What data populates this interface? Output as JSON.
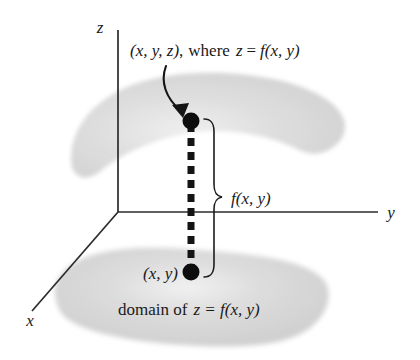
{
  "figure": {
    "background_color": "#ffffff",
    "ink_color": "#1a1a1a",
    "surface_color": "#d8d8d8"
  },
  "axes": {
    "z_label": "z",
    "y_label": "y",
    "x_label": "x",
    "origin": {
      "x": 118,
      "y": 212
    }
  },
  "labels": {
    "point_3d": {
      "prefix": "(x, y, z)",
      "comma": ",",
      "where": "where",
      "equation_lhs": "z",
      "equals": "=",
      "equation_rhs": "f(x, y)",
      "full_text": "(x, y, z), where z = f(x, y)"
    },
    "point_2d": "(x, y)",
    "height_label": "f(x, y)",
    "domain_label": {
      "prefix": "domain of",
      "equation": "z = f(x, y)",
      "full_text": "domain of z = f(x, y)"
    }
  },
  "points": {
    "upper": {
      "label": "(x, y, z)",
      "x": 191,
      "y": 121
    },
    "lower": {
      "label": "(x, y)",
      "x": 191,
      "y": 272
    }
  },
  "surfaces": {
    "upper_surface_name": "graph of f",
    "lower_surface_name": "domain of f"
  }
}
